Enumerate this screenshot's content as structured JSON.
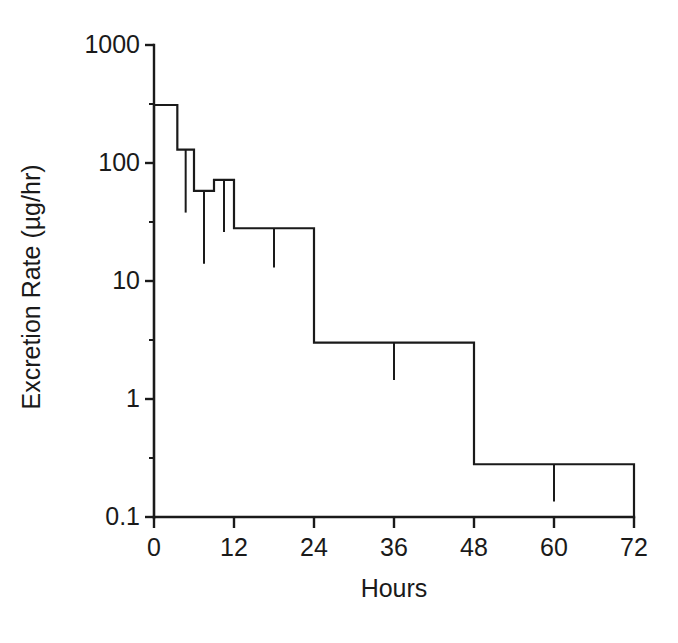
{
  "chart_data": {
    "type": "line",
    "subtype": "step-histogram-with-error-bars",
    "title": "",
    "xlabel": "Hours",
    "ylabel": "Excretion Rate (µg/hr)",
    "yscale": "log",
    "xlim": [
      0,
      72
    ],
    "ylim": [
      0.1,
      1000
    ],
    "grid": false,
    "legend": null,
    "x_ticks": [
      0,
      12,
      24,
      36,
      48,
      60,
      72
    ],
    "x_tick_labels": [
      "0",
      "12",
      "24",
      "36",
      "48",
      "60",
      "72"
    ],
    "x_minor_ticks": [
      6,
      18,
      30,
      42,
      54,
      66
    ],
    "y_ticks": [
      0.1,
      1,
      10,
      100,
      1000
    ],
    "y_tick_labels": [
      "0.1",
      "1",
      "10",
      "100",
      "1000"
    ],
    "bins": [
      {
        "x_start": 0,
        "x_end": 3.5,
        "value": 310,
        "err_low": 310
      },
      {
        "x_start": 3.5,
        "x_end": 6,
        "value": 130,
        "err_low": 38
      },
      {
        "x_start": 6,
        "x_end": 9,
        "value": 58,
        "err_low": 14
      },
      {
        "x_start": 9,
        "x_end": 12,
        "value": 72,
        "err_low": 26
      },
      {
        "x_start": 12,
        "x_end": 24,
        "value": 28,
        "err_low": 13
      },
      {
        "x_start": 24,
        "x_end": 48,
        "value": 3.0,
        "err_low": 1.45
      },
      {
        "x_start": 48,
        "x_end": 72,
        "value": 0.28,
        "err_low": 0.135
      }
    ]
  },
  "figure": {
    "background_color": "#ffffff",
    "line_color": "#1a1a1a"
  }
}
